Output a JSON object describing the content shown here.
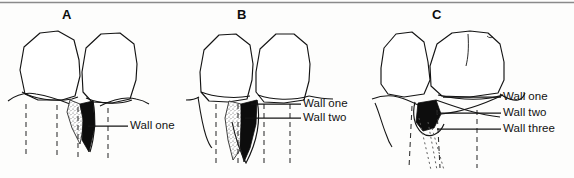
{
  "figure": {
    "caption_letters": [
      "A",
      "B",
      "C"
    ],
    "background_color": "#fdfdfc",
    "ink_color": "#121212",
    "stipple_color": "#6b6b6b",
    "fill_black": "#0d0d0d",
    "top_rule_color": "#8a8a8a"
  },
  "panels": [
    {
      "id": "A",
      "letter": "A",
      "letter_x": 62,
      "letter_y": 8,
      "defect_type": "one-wall",
      "dashed_root_lines": 4,
      "labels": [
        {
          "id": "a-wall-one",
          "text": "Wall  one",
          "word1": "Wall",
          "word2": "one",
          "x": 130,
          "y": 120,
          "leader_y": 126,
          "leader_x_start": 88,
          "leader_x_end": 128
        }
      ]
    },
    {
      "id": "B",
      "letter": "B",
      "letter_x": 237,
      "letter_y": 8,
      "defect_type": "two-wall",
      "dashed_root_lines": 4,
      "labels": [
        {
          "id": "b-wall-one",
          "text": "Wall  one",
          "word1": "Wall",
          "word2": "one",
          "x": 303,
          "y": 98,
          "leader_y": 104,
          "leader_x_start": 251,
          "leader_x_end": 301
        },
        {
          "id": "b-wall-two",
          "text": "Wall  two",
          "word1": "Wall",
          "word2": "two",
          "x": 303,
          "y": 112,
          "leader_y": 118,
          "leader_x_start": 245,
          "leader_x_end": 301
        }
      ]
    },
    {
      "id": "C",
      "letter": "C",
      "letter_x": 432,
      "letter_y": 8,
      "defect_type": "three-wall",
      "dashed_root_lines": 3,
      "dotted_root_lines": 3,
      "labels": [
        {
          "id": "c-wall-one",
          "text": "Wall  one",
          "word1": "Wall",
          "word2": "one",
          "x": 503,
          "y": 91,
          "leader_y": 97,
          "leader_x_start": 443,
          "leader_x_end": 501
        },
        {
          "id": "c-wall-two",
          "text": "Wall  two",
          "word1": "Wall",
          "word2": "two",
          "x": 503,
          "y": 107,
          "leader_y": 113,
          "leader_x_start": 437,
          "leader_x_end": 501
        },
        {
          "id": "c-wall-three",
          "text": "Wall  three",
          "word1": "Wall",
          "word2": "three",
          "x": 503,
          "y": 123,
          "leader_y": 129,
          "leader_x_start": 437,
          "leader_x_end": 501
        }
      ]
    }
  ]
}
